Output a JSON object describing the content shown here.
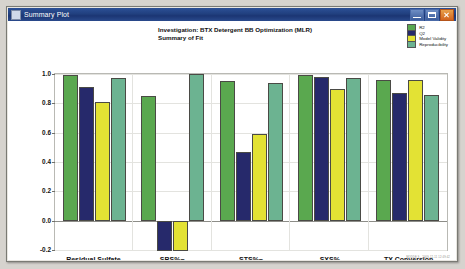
{
  "window": {
    "title": "Summary Plot",
    "icon": "plot-window-icon",
    "buttons": {
      "minimize": "minimize-button",
      "maximize": "maximize-button",
      "close": "close-button"
    }
  },
  "footer": {
    "stamp": "MODDE 9 - 2009-12-11 12:49:42"
  },
  "chart_data": {
    "type": "bar",
    "title": "Investigation: BTX Detergent BB Optimization (MLR)",
    "subtitle": "Summary of Fit",
    "xlabel": "",
    "ylabel": "",
    "grid": true,
    "legend_position": "top-right",
    "ylim": [
      -0.2,
      1.0
    ],
    "yticks": [
      "1.0",
      "0.8",
      "0.6",
      "0.4",
      "0.2",
      "0.0",
      "-0.2"
    ],
    "ytick_values": [
      1.0,
      0.8,
      0.6,
      0.4,
      0.2,
      0.0,
      -0.2
    ],
    "categories": [
      "Residual Sulfate",
      "SBS%~",
      "STS%~",
      "SXS%",
      "TX Conversion"
    ],
    "series": [
      {
        "name": "R2",
        "color": "#5aa84f",
        "values": [
          0.99,
          0.85,
          0.95,
          0.99,
          0.96
        ]
      },
      {
        "name": "Q2",
        "color": "#26296b",
        "values": [
          0.91,
          -0.21,
          0.47,
          0.98,
          0.87
        ]
      },
      {
        "name": "Model Validity",
        "color": "#e3e234",
        "values": [
          0.81,
          -0.21,
          0.59,
          0.9,
          0.96
        ]
      },
      {
        "name": "Reproducibility",
        "color": "#6cb391",
        "values": [
          0.97,
          1.0,
          0.94,
          0.97,
          0.86
        ]
      }
    ]
  }
}
